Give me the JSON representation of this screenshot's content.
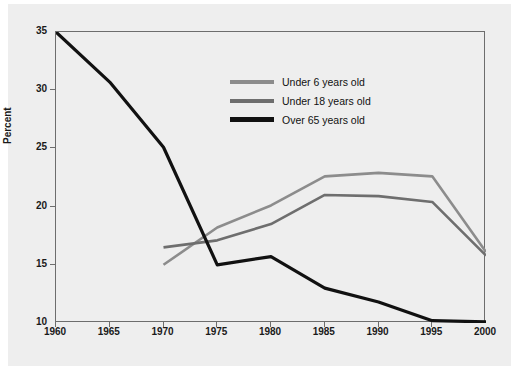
{
  "chart_data": {
    "type": "line",
    "title": "",
    "xlabel": "",
    "ylabel": "Percent",
    "x": [
      1960,
      1965,
      1970,
      1975,
      1980,
      1985,
      1990,
      1995,
      2000
    ],
    "xtick_labels": [
      "1960",
      "1965",
      "1970",
      "1975",
      "1980",
      "1985",
      "1990",
      "1995",
      "2000"
    ],
    "ytick_labels": [
      "10",
      "15",
      "20",
      "25",
      "30",
      "35"
    ],
    "yticks": [
      10,
      15,
      20,
      25,
      30,
      35
    ],
    "xlim": [
      1960,
      2000
    ],
    "ylim": [
      10,
      35
    ],
    "grid": false,
    "legend_position": "upper-center",
    "series": [
      {
        "name": "Under 6 years old",
        "color": "#8c8c8c",
        "values": [
          27.2,
          null,
          15.0,
          18.2,
          20.1,
          22.6,
          22.9,
          22.6,
          16.1
        ]
      },
      {
        "name": "Under 18 years old",
        "color": "#6e6e6e",
        "values": [
          27.2,
          null,
          16.5,
          17.1,
          18.5,
          21.0,
          20.9,
          20.4,
          15.8
        ]
      },
      {
        "name": "Over 65 years old",
        "color": "#111111",
        "values": [
          35.0,
          30.7,
          25.1,
          15.0,
          15.7,
          13.0,
          11.8,
          10.2,
          10.1
        ]
      }
    ]
  },
  "legend": {
    "items": [
      {
        "label": "Under 6 years old",
        "color": "#8c8c8c"
      },
      {
        "label": "Under 18 years old",
        "color": "#6e6e6e"
      },
      {
        "label": "Over 65 years old",
        "color": "#111111"
      }
    ]
  },
  "axes": {
    "y_title": "Percent"
  },
  "colors": {
    "panel_background": "#eeeeee",
    "page_background": "#ffffff",
    "frame": "#6d6d6d",
    "text": "#1a1a1a"
  }
}
